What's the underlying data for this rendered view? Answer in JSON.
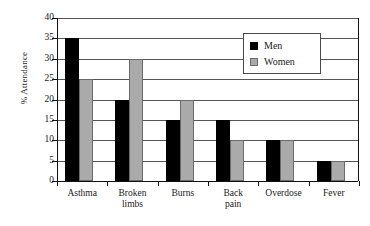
{
  "chart_data": {
    "type": "bar",
    "title": "",
    "subtitle": "",
    "xlabel": "",
    "ylabel": "% Attendance",
    "categories": [
      "Asthma",
      "Broken limbs",
      "Burns",
      "Back pain",
      "Overdose",
      "Fever"
    ],
    "category_lines": [
      [
        "Asthma"
      ],
      [
        "Broken",
        "limbs"
      ],
      [
        "Burns"
      ],
      [
        "Back",
        "pain"
      ],
      [
        "Overdose"
      ],
      [
        "Fever"
      ]
    ],
    "series": [
      {
        "name": "Men",
        "color": "#000000",
        "values": [
          35,
          20,
          15,
          15,
          10,
          5
        ]
      },
      {
        "name": "Women",
        "color": "#aaaaaa",
        "values": [
          25,
          30,
          20,
          10,
          10,
          5
        ]
      }
    ],
    "ylim": [
      0,
      40
    ],
    "ytick_step": 5,
    "yticks": [
      40,
      35,
      30,
      25,
      20,
      15,
      10,
      5,
      0
    ],
    "ytick_labels": [
      "40",
      "35",
      "30",
      "25",
      "20",
      "15",
      "10",
      "5",
      "0"
    ],
    "grid": true,
    "grid_axis": "y",
    "legend_position": "top-right-inside",
    "legend_entries": [
      "Men",
      "Women"
    ]
  }
}
